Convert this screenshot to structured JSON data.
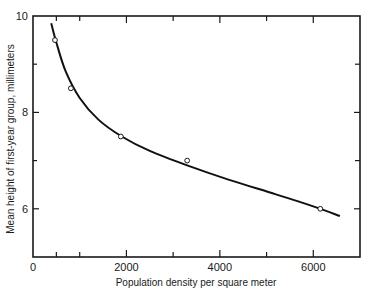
{
  "chart_data": {
    "type": "scatter",
    "title": "",
    "xlabel": "Population density per square meter",
    "ylabel": "Mean height of first-year group, millimeters",
    "xlim": [
      0,
      7000
    ],
    "ylim": [
      5,
      10
    ],
    "x_ticks": [
      0,
      2000,
      4000,
      6000
    ],
    "x_tick_labels": [
      "0",
      "2000",
      "4000",
      "6000"
    ],
    "x_minor_ticks": [
      500,
      1000,
      3000,
      5000
    ],
    "y_ticks": [
      6,
      8,
      10
    ],
    "y_tick_labels": [
      "6",
      "8",
      "10"
    ],
    "y_minor_ticks": [
      7,
      9
    ],
    "grid": false,
    "legend": null,
    "series": [
      {
        "name": "Observed",
        "marker": "open-circle",
        "x": [
          470,
          810,
          1880,
          3300,
          6150
        ],
        "y": [
          9.5,
          8.5,
          7.5,
          7.0,
          6.0
        ]
      },
      {
        "name": "Fitted curve",
        "style": "line",
        "x": [
          390,
          500,
          700,
          1000,
          1400,
          1900,
          2500,
          3300,
          4200,
          5200,
          6000,
          6570
        ],
        "y": [
          9.85,
          9.45,
          8.85,
          8.3,
          7.85,
          7.5,
          7.2,
          6.9,
          6.6,
          6.3,
          6.05,
          5.85
        ]
      }
    ]
  }
}
